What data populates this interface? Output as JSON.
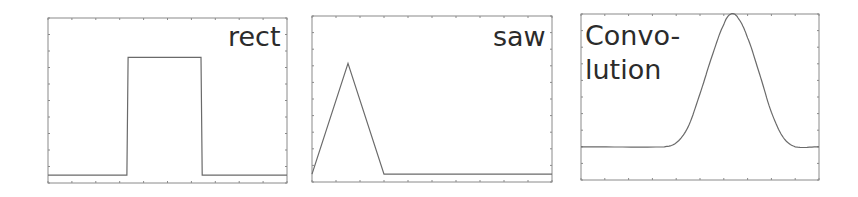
{
  "chart_data": [
    {
      "type": "line",
      "title": "rect",
      "x": [
        0,
        33,
        33.5,
        64,
        64.5,
        100
      ],
      "values": [
        0,
        0,
        0.75,
        0.75,
        0,
        0
      ],
      "xlim": [
        0,
        100
      ],
      "ylim": [
        -0.05,
        1.0
      ],
      "xlabel": "",
      "ylabel": "",
      "grid": false,
      "annotation": "rect"
    },
    {
      "type": "line",
      "title": "saw",
      "x": [
        0,
        15,
        30,
        100
      ],
      "values": [
        0,
        0.7,
        0,
        0
      ],
      "xlim": [
        0,
        100
      ],
      "ylim": [
        -0.05,
        1.0
      ],
      "xlabel": "",
      "ylabel": "",
      "grid": false,
      "annotation": "saw"
    },
    {
      "type": "line",
      "title": "Convolution",
      "x": [
        0,
        35,
        40,
        45,
        50,
        55,
        60,
        63,
        66,
        70,
        75,
        80,
        85,
        90,
        100
      ],
      "values": [
        0,
        0,
        0.03,
        0.15,
        0.4,
        0.68,
        0.92,
        1.0,
        0.97,
        0.82,
        0.55,
        0.26,
        0.07,
        0,
        0
      ],
      "xlim": [
        0,
        100
      ],
      "ylim": [
        -0.25,
        1.0
      ],
      "xlabel": "",
      "ylabel": "",
      "grid": false,
      "annotation": "Convo-\nlution"
    }
  ],
  "labels": {
    "rect": "rect",
    "saw": "saw",
    "conv_line1": "Convo-",
    "conv_line2": "lution"
  }
}
